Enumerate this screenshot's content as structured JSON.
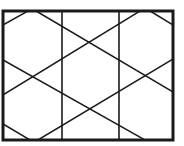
{
  "diagram": {
    "stroke_color": "#1a1a1a",
    "background": "#ffffff",
    "frame": {
      "x": 3,
      "y": 11,
      "width": 170,
      "height": 129,
      "stroke_width": 3
    },
    "verticals": [
      {
        "x": 62,
        "y1": 11,
        "y2": 140
      },
      {
        "x": 119,
        "y1": 11,
        "y2": 140
      }
    ],
    "diagonals": [
      {
        "x1": 3,
        "y1": 95,
        "x2": 140,
        "y2": 11
      },
      {
        "x1": 3,
        "y1": 60,
        "x2": 145,
        "y2": 140
      },
      {
        "x1": 36,
        "y1": 11,
        "x2": 173,
        "y2": 92
      },
      {
        "x1": 38,
        "y1": 140,
        "x2": 173,
        "y2": 59
      },
      {
        "x1": 3,
        "y1": 25,
        "x2": 28,
        "y2": 11
      },
      {
        "x1": 3,
        "y1": 124,
        "x2": 30,
        "y2": 140
      },
      {
        "x1": 150,
        "y1": 11,
        "x2": 173,
        "y2": 25
      }
    ]
  }
}
